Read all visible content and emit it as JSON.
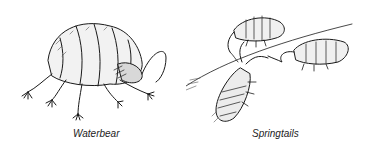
{
  "figures": [
    {
      "id": "waterbear",
      "caption": "Waterbear",
      "description": "Black-and-white ink illustration of a tardigrade (waterbear) with segmented body and clawed legs"
    },
    {
      "id": "springtails",
      "caption": "Springtails",
      "description": "Black-and-white ink illustration of three springtails on a surface with antennae and segmented bodies"
    }
  ],
  "colors": {
    "background": "#ffffff",
    "ink": "#1a1a1a",
    "caption": "#222222"
  }
}
